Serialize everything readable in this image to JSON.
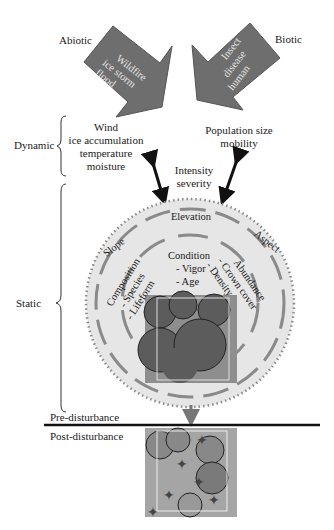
{
  "diagram": {
    "categories": {
      "abiotic": "Abiotic",
      "biotic": "Biotic",
      "dynamic": "Dynamic",
      "static": "Static"
    },
    "abiotic_arrow": [
      "Wildfire",
      "ice storm",
      "flood"
    ],
    "biotic_arrow": [
      "Insect",
      "disease",
      "human"
    ],
    "dynamic_abiotic": [
      "Wind",
      "ice accumulation",
      "temperature",
      "moisture"
    ],
    "dynamic_biotic": [
      "Population size",
      "mobility"
    ],
    "interaction": [
      "Intensity",
      "severity"
    ],
    "outer_ring": {
      "top": "Elevation",
      "left": "Slope",
      "right": "Aspect"
    },
    "inner_ring": {
      "center_title": "Condition",
      "center_items": [
        "- Vigor",
        "- Age"
      ],
      "left_title": "Composition",
      "left_items": [
        "- Species",
        "- Lifeform"
      ],
      "right_title": "Abundance",
      "right_items": [
        "- Crown cover",
        "- Density"
      ]
    },
    "phases": {
      "pre": "Pre-disturbance",
      "post": "Post-disturbance"
    },
    "colors": {
      "arrow_fill": "#6e6e6e",
      "circle_fill": "#e6e6e6",
      "ring_dash": "#8a8a8a",
      "canopy_dark": "#5c5c5c",
      "canopy_bg": "#9a9a9a"
    }
  }
}
